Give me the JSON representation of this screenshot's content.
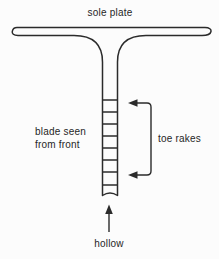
{
  "figure": {
    "labels": {
      "sole_plate": "sole plate",
      "blade_line1": "blade seen",
      "blade_line2": "from front",
      "toe_rakes": "toe rakes",
      "hollow": "hollow"
    },
    "diagram": {
      "toe_rake_line_count": 8,
      "toe_rake_lines_y": [
        100,
        112,
        124,
        136,
        148,
        160,
        172,
        185
      ],
      "line_color": "#2b2b2b",
      "background_color": "#fcfcfc",
      "text_color": "#262626"
    }
  }
}
